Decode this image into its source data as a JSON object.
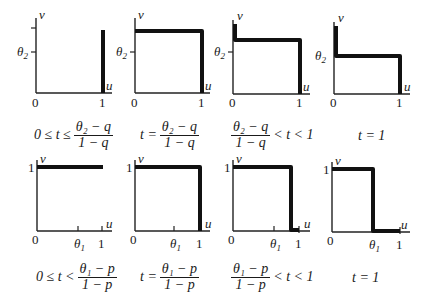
{
  "axis_labels": {
    "x": "u",
    "y": "v",
    "origin": "0",
    "one": "1",
    "theta2": "θ",
    "theta2_sub": "2",
    "theta1": "θ",
    "theta1_sub": "1"
  },
  "row1": {
    "captions": [
      {
        "prefix": "0 ≤ t ≤",
        "num": "θ₂ − q",
        "den": "1 − q",
        "suffix": ""
      },
      {
        "prefix": "t =",
        "num": "θ₂ − q",
        "den": "1 − q",
        "suffix": ""
      },
      {
        "prefix": "",
        "num": "θ₂ − q",
        "den": "1 − q",
        "suffix": "< t < 1"
      },
      {
        "prefix": "t = 1",
        "num": "",
        "den": "",
        "suffix": ""
      }
    ]
  },
  "row2": {
    "captions": [
      {
        "prefix": "0 ≤ t <",
        "num": "θ₁ − p",
        "den": "1 − p",
        "suffix": ""
      },
      {
        "prefix": "t =",
        "num": "θ₁ − p",
        "den": "1 − p",
        "suffix": ""
      },
      {
        "prefix": "",
        "num": "θ₁ − p",
        "den": "1 − p",
        "suffix": "< t < 1"
      },
      {
        "prefix": "t = 1",
        "num": "",
        "den": "",
        "suffix": ""
      }
    ]
  },
  "colors": {
    "ink": "#111111",
    "background": "#ffffff"
  }
}
